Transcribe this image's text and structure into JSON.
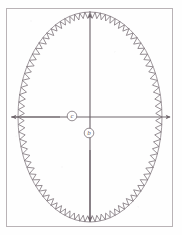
{
  "figure": {
    "background_color": "#fefefe",
    "border": {
      "x": 6,
      "y": 8,
      "width": 167,
      "height": 219,
      "stroke_color": "#b9b3b6",
      "stroke_width": 1
    },
    "ink_color": "#6f666c",
    "ellipse": {
      "center_x": 90,
      "center_y": 117,
      "radius_x": 72,
      "radius_y": 105,
      "stroke_color": "#8d858b",
      "stroke_width": 0.9
    },
    "sawtooth": {
      "label": "sawtooth-wave-on-ellipse",
      "teeth_count": 88,
      "amplitude": 7,
      "direction": "inward",
      "stroke_color": "#7b7278",
      "stroke_width": 0.8
    },
    "axes": {
      "vertical": {
        "label": "vertical-axis",
        "x": 90,
        "y_top": 13,
        "y_bottom": 222,
        "arrow_top": true,
        "arrow_bottom": true,
        "stroke_color": "#6f666c"
      },
      "horizontal": {
        "label": "horizontal-axis",
        "y": 117,
        "x_left": 11,
        "x_right": 170,
        "arrow_left": true,
        "arrow_right": true,
        "stroke_color": "#6f666c"
      }
    },
    "annotations": [
      {
        "id": "label-c",
        "text": "c",
        "cx": 72,
        "cy": 116,
        "radius": 5,
        "circled": true
      },
      {
        "id": "label-b",
        "text": "b",
        "cx": 89,
        "cy": 133,
        "radius": 5,
        "circled": true
      }
    ]
  }
}
